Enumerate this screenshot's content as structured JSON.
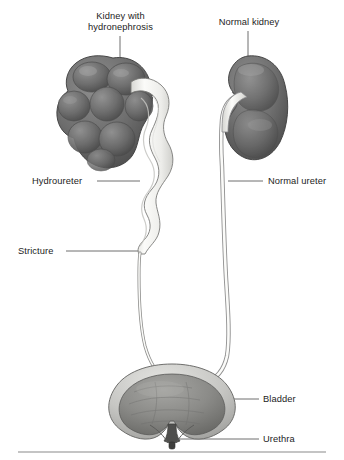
{
  "figure": {
    "background_color": "#ffffff",
    "baseline_rule_color": "#8a8a8a"
  },
  "labels": {
    "kidney_hydronephrosis": "Kidney with hydronephrosis",
    "kidney_hydronephrosis_line1": "Kidney with",
    "kidney_hydronephrosis_line2": "hydronephrosis",
    "normal_kidney": "Normal kidney",
    "hydroureter": "Hydroureter",
    "stricture": "Stricture",
    "normal_ureter": "Normal ureter",
    "bladder": "Bladder",
    "urethra": "Urethra"
  },
  "structures": {
    "kidney_hydronephrosis": {
      "name": "Kidney with hydronephrosis",
      "side": "left",
      "appearance": "enlarged, lobulated, multiple dilated calyces",
      "fill_color": "#6e6e6e"
    },
    "normal_kidney": {
      "name": "Normal kidney",
      "side": "right",
      "appearance": "smooth bean shape with concave hilum",
      "fill_color": "#6e6e6e"
    },
    "hydroureter": {
      "name": "Hydroureter",
      "appearance": "markedly dilated and tortuous upper ureter",
      "fill_color": "#f2f2f0"
    },
    "stricture": {
      "name": "Stricture",
      "appearance": "abrupt narrowing of the ureter below the dilated segment"
    },
    "normal_ureter": {
      "name": "Normal ureter",
      "appearance": "thin uniform caliber tube",
      "fill_color": "#f5f5f3"
    },
    "bladder": {
      "name": "Bladder",
      "appearance": "rounded distended bladder with thick wall and trabeculated interior",
      "wall_color": "#c9c9c7",
      "lumen_color": "#8d8d8b"
    },
    "urethra": {
      "name": "Urethra",
      "appearance": "short outlet at the bladder neck"
    }
  },
  "leaders": {
    "kidney_hydronephrosis": "vertical line from label down to upper pole of hydronephrotic kidney",
    "normal_kidney": "vertical line from label down to upper pole of normal kidney",
    "hydroureter": "horizontal line from label right to the dilated ureter",
    "stricture": "horizontal line from label right to the narrowed ureter segment",
    "normal_ureter": "horizontal line from label left to the normal ureter",
    "bladder": "horizontal line from label left to bladder lumen",
    "urethra": "horizontal line from label left to bladder neck"
  }
}
